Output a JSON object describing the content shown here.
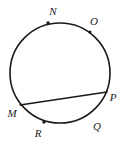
{
  "figure": {
    "type": "circle-geometry-diagram",
    "background_color": "#ffffff",
    "stroke_color": "#1a1a1a",
    "canvas": {
      "width": 128,
      "height": 146
    },
    "circle": {
      "name": "main-circle",
      "center_x": 60,
      "center_y": 73,
      "radius": 50,
      "stroke_width": 1.6
    },
    "chord": {
      "name": "chord-mp",
      "from_label": "M",
      "to_label": "P",
      "x1": 20,
      "y1": 105,
      "x2": 107,
      "y2": 92,
      "stroke_width": 1.6
    },
    "points": [
      {
        "label": "N",
        "label_x": 53,
        "label_y": 11,
        "dot_x": 48,
        "dot_y": 23,
        "dot": true,
        "dot_r": 1.7
      },
      {
        "label": "O",
        "label_x": 94,
        "label_y": 21,
        "dot_x": 90,
        "dot_y": 32,
        "dot": true,
        "dot_r": 1.5
      },
      {
        "label": "P",
        "label_x": 113,
        "label_y": 97,
        "dot_x": 107,
        "dot_y": 92,
        "dot": false,
        "dot_r": 1.5
      },
      {
        "label": "Q",
        "label_x": 97,
        "label_y": 126,
        "dot_x": 92,
        "dot_y": 115,
        "dot": false,
        "dot_r": 1.5
      },
      {
        "label": "R",
        "label_x": 38,
        "label_y": 133,
        "dot_x": 44,
        "dot_y": 122,
        "dot": true,
        "dot_r": 1.7
      },
      {
        "label": "M",
        "label_x": 12,
        "label_y": 113,
        "dot_x": 20,
        "dot_y": 105,
        "dot": false,
        "dot_r": 1.5
      }
    ]
  }
}
